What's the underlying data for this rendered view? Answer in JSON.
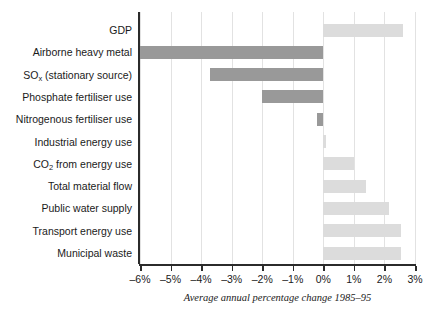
{
  "chart_data": {
    "type": "bar",
    "orientation": "horizontal",
    "title": "",
    "xlabel": "Average annual percentage change 1985–95",
    "ylabel": "",
    "xlim": [
      -6,
      3
    ],
    "xticks": [
      -6,
      -5,
      -4,
      -3,
      -2,
      -1,
      0,
      1,
      2,
      3
    ],
    "xtick_labels": [
      "–6%",
      "–5%",
      "–4%",
      "–3%",
      "–2%",
      "–1%",
      "0%",
      "1%",
      "2%",
      "3%"
    ],
    "grid": true,
    "legend": "none",
    "colors": {
      "negative_bar": "#999999",
      "positive_bar": "#dcdcdc",
      "axis": "#2b2b2b",
      "gridline": "#e2e2e2",
      "text": "#1a1a1a",
      "background": "#ffffff"
    },
    "categories": [
      "GDP",
      "Airborne heavy metal",
      "SOx (stationary source)",
      "Phosphate fertiliser use",
      "Nitrogenous fertiliser use",
      "Industrial energy use",
      "CO2 from energy use",
      "Total material flow",
      "Public water supply",
      "Transport energy use",
      "Municipal waste"
    ],
    "values": [
      2.6,
      -6.0,
      -3.7,
      -2.0,
      -0.2,
      0.1,
      1.0,
      1.4,
      2.15,
      2.55,
      2.55
    ],
    "bars": [
      {
        "label": "GDP",
        "label_html": "GDP",
        "value": 2.6,
        "tone": "pos"
      },
      {
        "label": "Airborne heavy metal",
        "label_html": "Airborne heavy metal",
        "value": -6.0,
        "tone": "neg"
      },
      {
        "label": "SOx (stationary source)",
        "label_html": "SO<span class=\"sub\">x</span> (stationary source)",
        "value": -3.7,
        "tone": "neg"
      },
      {
        "label": "Phosphate fertiliser use",
        "label_html": "Phosphate fertiliser use",
        "value": -2.0,
        "tone": "neg"
      },
      {
        "label": "Nitrogenous fertiliser use",
        "label_html": "Nitrogenous fertiliser use",
        "value": -0.2,
        "tone": "neg"
      },
      {
        "label": "Industrial energy use",
        "label_html": "Industrial energy use",
        "value": 0.1,
        "tone": "pos"
      },
      {
        "label": "CO2 from energy use",
        "label_html": "CO<span class=\"sub\">2</span> from energy use",
        "value": 1.0,
        "tone": "pos"
      },
      {
        "label": "Total material flow",
        "label_html": "Total material flow",
        "value": 1.4,
        "tone": "pos"
      },
      {
        "label": "Public water supply",
        "label_html": "Public water supply",
        "value": 2.15,
        "tone": "pos"
      },
      {
        "label": "Transport energy use",
        "label_html": "Transport energy use",
        "value": 2.55,
        "tone": "pos"
      },
      {
        "label": "Municipal waste",
        "label_html": "Municipal waste",
        "value": 2.55,
        "tone": "pos"
      }
    ]
  }
}
